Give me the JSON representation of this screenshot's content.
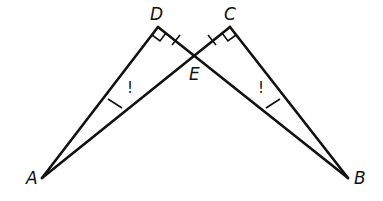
{
  "diagram": {
    "type": "geometry",
    "points": {
      "A": {
        "label": "A",
        "x": 42,
        "y": 178
      },
      "B": {
        "label": "B",
        "x": 348,
        "y": 178
      },
      "C": {
        "label": "C",
        "x": 230,
        "y": 27
      },
      "D": {
        "label": "D",
        "x": 158,
        "y": 27
      },
      "E": {
        "label": "E",
        "x": 194,
        "y": 55
      }
    },
    "segments": [
      "AD",
      "DB",
      "BC",
      "CA"
    ],
    "right_angles": [
      "D",
      "C"
    ],
    "congruence_marks": {
      "single_tick_DE_CE": [
        "DE",
        "CE"
      ],
      "single_tick_AD_BC": [
        "AD",
        "BC"
      ]
    },
    "angle_marks": [
      {
        "at": "A",
        "symbol": "!"
      },
      {
        "at": "B",
        "symbol": "!"
      }
    ]
  }
}
